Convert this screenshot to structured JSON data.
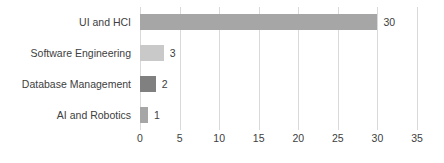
{
  "chart_data": {
    "type": "bar",
    "orientation": "horizontal",
    "title": "",
    "subtitle": "",
    "xlabel": "",
    "ylabel": "",
    "categories": [
      "UI and HCI",
      "Software Engineering",
      "Database Management",
      "AI and Robotics"
    ],
    "values": [
      30,
      3,
      2,
      1
    ],
    "data_labels": [
      "30",
      "3",
      "2",
      "1"
    ],
    "bar_colors": [
      "#a6a6a6",
      "#c9c9c9",
      "#808080",
      "#a6a6a6"
    ],
    "xlim": [
      0,
      35
    ],
    "ylim": null,
    "xticks": [
      0,
      5,
      10,
      15,
      20,
      25,
      30,
      35
    ],
    "xtick_labels": [
      "0",
      "5",
      "10",
      "15",
      "20",
      "25",
      "30",
      "35"
    ],
    "grid": true,
    "grid_axis": "x",
    "grid_color": "#d9d9d9",
    "legend": false,
    "legend_position": "none",
    "background_color": "#ffffff",
    "text_color": "#404040",
    "series": [
      {
        "name": "Count",
        "values": [
          30,
          3,
          2,
          1
        ]
      }
    ]
  }
}
